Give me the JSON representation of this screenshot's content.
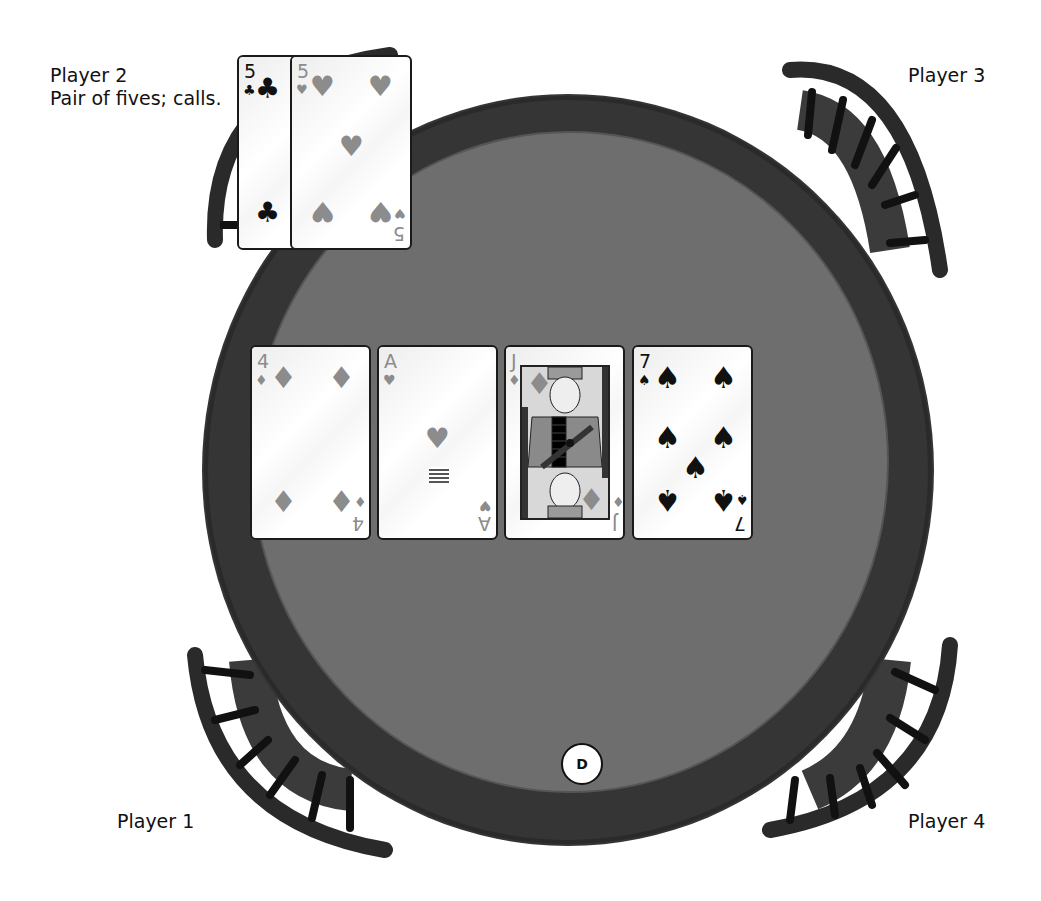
{
  "players": [
    {
      "id": 1,
      "name": "Player 1",
      "status": ""
    },
    {
      "id": 2,
      "name": "Player 2",
      "status": "Pair of fives; calls."
    },
    {
      "id": 3,
      "name": "Player 3",
      "status": ""
    },
    {
      "id": 4,
      "name": "Player 4",
      "status": ""
    }
  ],
  "player2_hand": [
    {
      "rank": "5",
      "suit": "clubs",
      "suit_glyph": "♣",
      "color": "#111111"
    },
    {
      "rank": "5",
      "suit": "hearts",
      "suit_glyph": "♥",
      "color": "#8c8c8c"
    }
  ],
  "community_cards": [
    {
      "rank": "4",
      "suit": "diamonds",
      "suit_glyph": "♦",
      "color": "#8c8c8c"
    },
    {
      "rank": "A",
      "suit": "hearts",
      "suit_glyph": "♥",
      "color": "#8c8c8c"
    },
    {
      "rank": "J",
      "suit": "diamonds",
      "suit_glyph": "♦",
      "color": "#8c8c8c"
    },
    {
      "rank": "7",
      "suit": "spades",
      "suit_glyph": "♠",
      "color": "#111111"
    }
  ],
  "dealer_button": {
    "label": "D"
  },
  "colors": {
    "felt": "#6e6e6e",
    "rim": "#3a3a3a",
    "chair": "#2a2a2a",
    "background": "#ffffff"
  }
}
